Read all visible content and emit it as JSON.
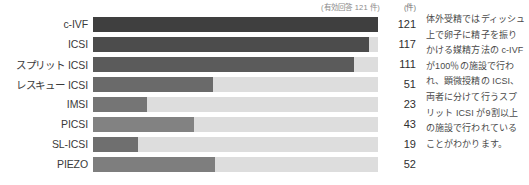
{
  "chart_data": {
    "type": "bar",
    "orientation": "horizontal",
    "title": "",
    "xlabel": "",
    "ylabel": "",
    "unit_label": "(件)",
    "valid_responses_note": "(有効回答 121 件)",
    "denominator": 121,
    "xlim": [
      0,
      121
    ],
    "grid": false,
    "legend": "none",
    "categories": [
      "c-IVF",
      "ICSI",
      "スプリット ICSI",
      "レスキュー ICSI",
      "IMSI",
      "PICSI",
      "SL-ICSI",
      "PIEZO"
    ],
    "values": [
      121,
      117,
      111,
      51,
      23,
      43,
      19,
      52
    ],
    "bar_colors": [
      "#3f3f3f",
      "#4c4c4c",
      "#5b5b5b",
      "#6a6a6a",
      "#757575",
      "#828282",
      "#6f6f6f",
      "#7e7e7e"
    ],
    "track_color": "#dddddd"
  },
  "note": {
    "text": "体外受精ではディッシュ上で卵子に精子を振りかける媒精方法の c-IVF が100％の施設で行われ、顕微授精の ICSI、両者に分けて行うスプリット ICSI が9割以上の施設で行われていることがわかります。"
  },
  "footnote": {
    "text": ""
  }
}
